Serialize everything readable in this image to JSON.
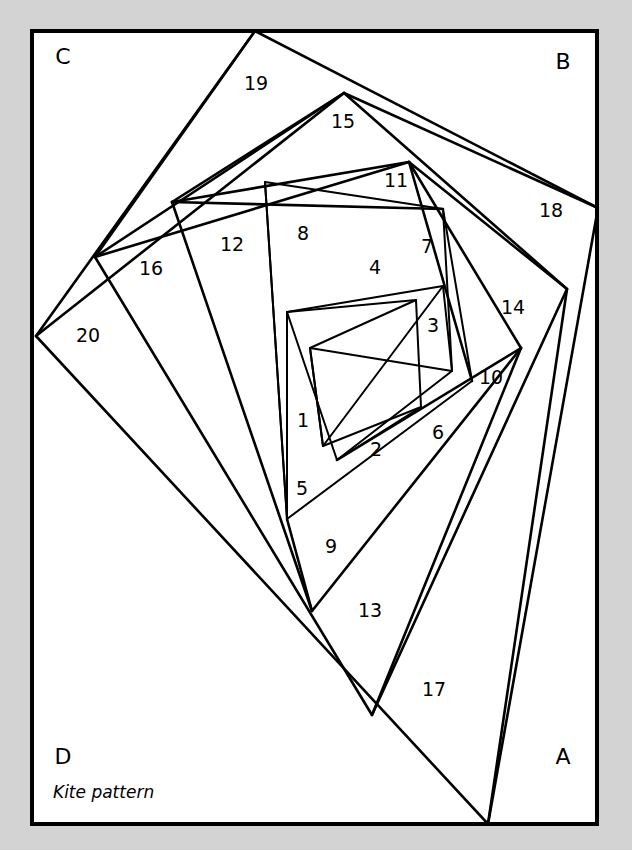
{
  "figure": {
    "caption": "Kite pattern",
    "background_color": "#d3d3d3",
    "plate_color": "#ffffff",
    "line_color": "#000000",
    "plate": {
      "x": 32,
      "y": 31,
      "width": 565,
      "height": 793
    }
  },
  "corner_labels": [
    {
      "name": "corner-label-c",
      "text": "C",
      "x": 63,
      "y": 58
    },
    {
      "name": "corner-label-b",
      "text": "B",
      "x": 563,
      "y": 63
    },
    {
      "name": "corner-label-d",
      "text": "D",
      "x": 63,
      "y": 758
    },
    {
      "name": "corner-label-a",
      "text": "A",
      "x": 563,
      "y": 758
    }
  ],
  "caption": {
    "text": "Kite pattern",
    "x": 53,
    "y": 793
  },
  "cells": [
    {
      "id": 1,
      "label": "1",
      "x": 303,
      "y": 421
    },
    {
      "id": 2,
      "label": "2",
      "x": 376,
      "y": 450
    },
    {
      "id": 3,
      "label": "3",
      "x": 433,
      "y": 326
    },
    {
      "id": 4,
      "label": "4",
      "x": 375,
      "y": 268
    },
    {
      "id": 5,
      "label": "5",
      "x": 302,
      "y": 489
    },
    {
      "id": 6,
      "label": "6",
      "x": 438,
      "y": 433
    },
    {
      "id": 7,
      "label": "7",
      "x": 427,
      "y": 247
    },
    {
      "id": 8,
      "label": "8",
      "x": 303,
      "y": 234
    },
    {
      "id": 9,
      "label": "9",
      "x": 331,
      "y": 547
    },
    {
      "id": 10,
      "label": "10",
      "x": 491,
      "y": 378
    },
    {
      "id": 11,
      "label": "11",
      "x": 396,
      "y": 181
    },
    {
      "id": 12,
      "label": "12",
      "x": 232,
      "y": 245
    },
    {
      "id": 13,
      "label": "13",
      "x": 370,
      "y": 611
    },
    {
      "id": 14,
      "label": "14",
      "x": 513,
      "y": 308
    },
    {
      "id": 15,
      "label": "15",
      "x": 343,
      "y": 122
    },
    {
      "id": 16,
      "label": "16",
      "x": 151,
      "y": 269
    },
    {
      "id": 17,
      "label": "17",
      "x": 434,
      "y": 690
    },
    {
      "id": 18,
      "label": "18",
      "x": 551,
      "y": 211
    },
    {
      "id": 19,
      "label": "19",
      "x": 256,
      "y": 84
    },
    {
      "id": 20,
      "label": "20",
      "x": 88,
      "y": 336
    }
  ],
  "geometry": {
    "description": "Four-armed logarithmic spiral of quadrilateral kites inscribed in the rectangle; successive hub vertices converge toward the centre.",
    "polylines": [
      {
        "name": "ring-0-quad",
        "points": "255,31 598,208 488,824 36,336 255,31"
      },
      {
        "name": "ring-1-quad",
        "points": "344,93 567,289 372,715 95,257 344,93"
      },
      {
        "name": "ring-2-quad",
        "points": "409,162 521,348 312,611 172,202 409,162"
      },
      {
        "name": "ring-3-quad",
        "points": "443,209 472,381 287,519 265,182 443,209"
      },
      {
        "name": "ring-4-quad",
        "points": "443,286 452,371 337,460 287,312 443,286"
      },
      {
        "name": "ring-5-quad",
        "points": "416,300 421,407 323,446 310,348 416,300"
      },
      {
        "name": "spoke-19-15",
        "points": "255,31 95,257"
      },
      {
        "name": "spoke-15-11",
        "points": "344,93 172,202"
      },
      {
        "name": "spoke-18-14",
        "points": "598,208 344,93"
      },
      {
        "name": "spoke-14-10",
        "points": "567,289 409,162"
      },
      {
        "name": "spoke-17-13",
        "points": "488,824 567,289"
      },
      {
        "name": "spoke-13-9",
        "points": "372,715 521,348"
      },
      {
        "name": "spoke-20-16",
        "points": "36,336 344,93"
      },
      {
        "name": "spoke-16-12",
        "points": "95,257 409,162"
      },
      {
        "name": "spoke-12-8",
        "points": "172,202 443,209"
      },
      {
        "name": "spoke-8-4",
        "points": "265,182 287,519"
      },
      {
        "name": "spoke-11-7",
        "points": "409,162 472,381"
      },
      {
        "name": "spoke-7-3",
        "points": "443,209 452,371"
      },
      {
        "name": "spoke-10-6",
        "points": "521,348 337,460"
      },
      {
        "name": "spoke-9-5",
        "points": "312,611 287,519"
      },
      {
        "name": "spoke-5-1",
        "points": "287,519 287,312"
      },
      {
        "name": "spoke-4-inner",
        "points": "287,312 416,300"
      },
      {
        "name": "spoke-3-inner",
        "points": "443,286 323,446"
      },
      {
        "name": "spoke-6-2",
        "points": "452,371 310,348"
      },
      {
        "name": "spoke-2-inner",
        "points": "337,460 421,407"
      },
      {
        "name": "spoke-1-inner",
        "points": "310,348 323,446"
      }
    ]
  }
}
